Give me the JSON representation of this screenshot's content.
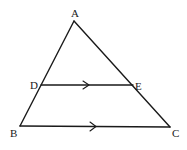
{
  "diagram": {
    "type": "geometry",
    "points": {
      "A": {
        "label": "A",
        "x": 74,
        "y": 21,
        "label_x": 71,
        "label_y": 17
      },
      "B": {
        "label": "B",
        "x": 20,
        "y": 126,
        "label_x": 10,
        "label_y": 137
      },
      "C": {
        "label": "C",
        "x": 170,
        "y": 127,
        "label_x": 172,
        "label_y": 137
      },
      "D": {
        "label": "D",
        "x": 41,
        "y": 85,
        "label_x": 30,
        "label_y": 89
      },
      "E": {
        "label": "E",
        "x": 133,
        "y": 85,
        "label_x": 135,
        "label_y": 90
      }
    },
    "segments": [
      {
        "name": "AB",
        "from": "A",
        "to": "B"
      },
      {
        "name": "AC",
        "from": "A",
        "to": "C"
      },
      {
        "name": "DE",
        "from": "D",
        "to": "E",
        "parallel_mark": true
      },
      {
        "name": "BC",
        "from": "B",
        "to": "C",
        "parallel_mark": true
      }
    ],
    "parallel_marks": [
      {
        "segment": "DE",
        "x": 88,
        "y": 85
      },
      {
        "segment": "BC",
        "x": 96,
        "y": 126
      }
    ],
    "colors": {
      "stroke": "#1a1a1a",
      "background": "#ffffff"
    }
  }
}
